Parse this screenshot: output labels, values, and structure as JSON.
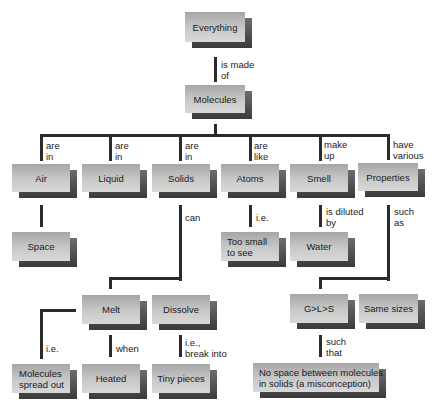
{
  "diagram": {
    "type": "concept-map",
    "colors": {
      "node_face_top": "#a6a6a6",
      "node_face_bottom": "#d8d8d8",
      "node_shadow": "#3a3a3a",
      "line": "#2b2b2b",
      "background": "#ffffff"
    },
    "nodes": {
      "everything": "Everything",
      "molecules": "Molecules",
      "air": "Air",
      "liquid": "Liquid",
      "solids": "Solids",
      "atoms": "Atoms",
      "smell": "Smell",
      "properties": "Properties",
      "space": "Space",
      "too_small": "Too small\nto see",
      "water": "Water",
      "melt": "Melt",
      "dissolve": "Dissolve",
      "gls": "G>L>S",
      "same_sizes": "Same sizes",
      "spread_out": "Molecules\nspread out",
      "heated": "Heated",
      "tiny_pieces": "Tiny pieces",
      "no_space": "No space between molecules\nin solids (a misconception)"
    },
    "links": {
      "everything_molecules": "is made\nof",
      "molecules_air": "are\nin",
      "molecules_liquid": "are\nin",
      "molecules_solids": "are\nin",
      "molecules_atoms": "are\nlike",
      "molecules_smell": "make\nup",
      "molecules_properties": "have\nvarious",
      "atoms_too_small": "i.e.",
      "smell_water": "is diluted\nby",
      "solids_melt_dissolve": "can",
      "properties_gls_same": "such\nas",
      "melt_spread_out": "i.e.",
      "melt_heated": "when",
      "dissolve_tiny": "i.e.,\nbreak into",
      "gls_no_space": "such\nthat"
    },
    "edges": [
      [
        "Everything",
        "Molecules",
        "is made of"
      ],
      [
        "Molecules",
        "Air",
        "are in"
      ],
      [
        "Molecules",
        "Liquid",
        "are in"
      ],
      [
        "Molecules",
        "Solids",
        "are in"
      ],
      [
        "Molecules",
        "Atoms",
        "are like"
      ],
      [
        "Molecules",
        "Smell",
        "make up"
      ],
      [
        "Molecules",
        "Properties",
        "have various"
      ],
      [
        "Air",
        "Space",
        ""
      ],
      [
        "Atoms",
        "Too small to see",
        "i.e."
      ],
      [
        "Smell",
        "Water",
        "is diluted by"
      ],
      [
        "Solids",
        "Melt",
        "can"
      ],
      [
        "Solids",
        "Dissolve",
        "can"
      ],
      [
        "Properties",
        "G>L>S",
        "such as"
      ],
      [
        "Properties",
        "Same sizes",
        "such as"
      ],
      [
        "Melt",
        "Molecules spread out",
        "i.e."
      ],
      [
        "Melt",
        "Heated",
        "when"
      ],
      [
        "Dissolve",
        "Tiny pieces",
        "i.e., break into"
      ],
      [
        "G>L>S",
        "No space between molecules in solids (a misconception)",
        "such that"
      ]
    ]
  }
}
